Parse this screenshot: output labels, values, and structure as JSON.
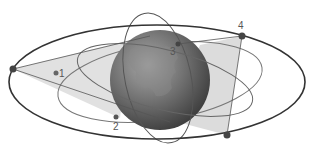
{
  "diagram": {
    "labels": [
      {
        "id": "sat-1",
        "text": "1",
        "x": 59,
        "y": 77
      },
      {
        "id": "sat-2",
        "text": "2",
        "x": 113,
        "y": 130
      },
      {
        "id": "sat-3",
        "text": "3",
        "x": 170,
        "y": 55
      },
      {
        "id": "sat-4",
        "text": "4",
        "x": 238,
        "y": 29
      }
    ],
    "colors": {
      "orbit": "#3a3a3a",
      "orbit_light": "#777777",
      "coverage": "#d8d8d8",
      "earth_dark": "#3f3f3f",
      "earth_light": "#9a9a9a",
      "satellite": "#4a4a4a"
    }
  }
}
